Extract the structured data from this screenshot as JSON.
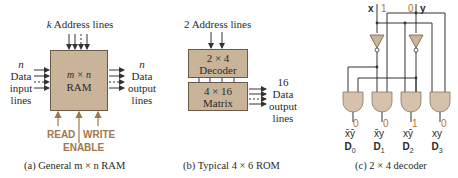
{
  "panel_a": {
    "address_label_var": "k",
    "address_label": "Address lines",
    "input_n": "n",
    "input_lines": [
      "Data",
      "input",
      "lines"
    ],
    "box_title": "m × n",
    "box_name": "RAM",
    "output_n": "n",
    "output_lines": [
      "Data",
      "output",
      "lines"
    ],
    "read": "READ",
    "write": "WRITE",
    "enable": "ENABLE",
    "caption": "(a) General m × n RAM"
  },
  "panel_b": {
    "address_label": "2 Address lines",
    "decoder_title": "2 × 4",
    "decoder_name": "Decoder",
    "matrix_title": "4 × 16",
    "matrix_name": "Matrix",
    "output_count": "16",
    "output_lines": [
      "Data",
      "output",
      "lines"
    ],
    "caption": "(b) Typical 4 × 6 ROM"
  },
  "panel_c": {
    "input_x": "x",
    "input_x_value": "1",
    "input_y": "y",
    "input_y_value": "0",
    "outputs": [
      {
        "value": "0",
        "term": "x̄ȳ",
        "name": "D",
        "sub": "0"
      },
      {
        "value": "0",
        "term": "x̄y",
        "name": "D",
        "sub": "1"
      },
      {
        "value": "1",
        "term": "xȳ",
        "name": "D",
        "sub": "2"
      },
      {
        "value": "0",
        "term": "xy",
        "name": "D",
        "sub": "3"
      }
    ],
    "caption": "(c) 2 × 4 decoder"
  },
  "colors": {
    "box_fill": "#c9b49a",
    "control": "#a0784e",
    "gate_fill": "#d6c2ac",
    "value": "#b0743a"
  }
}
